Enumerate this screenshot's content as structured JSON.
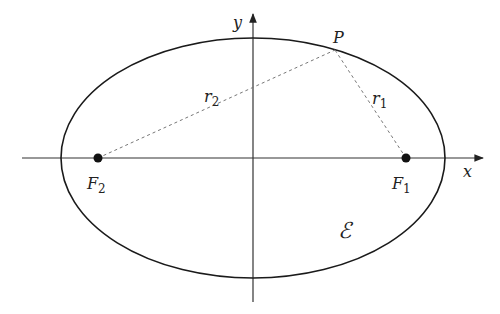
{
  "diagram": {
    "title": "",
    "colors": {
      "stroke": "#1a1a1a",
      "axis": "#333333",
      "dashed": "#777777",
      "background": "#ffffff"
    },
    "axes": {
      "x_label": "x",
      "y_label": "y"
    },
    "ellipse": {
      "label": "ℰ",
      "center": [
        253,
        158
      ],
      "rx": 192,
      "ry": 120
    },
    "point": {
      "label": "P",
      "pos": [
        335,
        50
      ]
    },
    "foci": [
      {
        "label": "F",
        "sub": "1",
        "pos": [
          406,
          158
        ]
      },
      {
        "label": "F",
        "sub": "2",
        "pos": [
          98,
          158
        ]
      }
    ],
    "distances": [
      {
        "label": "r",
        "sub": "1"
      },
      {
        "label": "r",
        "sub": "2"
      }
    ]
  }
}
